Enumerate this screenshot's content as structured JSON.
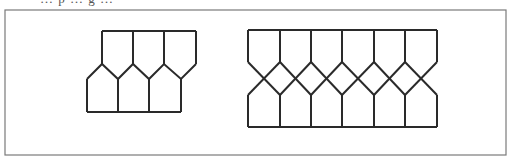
{
  "caption_fragment": "… p … g …",
  "figure": {
    "frame": {
      "x": 5,
      "y": 10,
      "width": 501,
      "height": 145,
      "stroke": "#7a7a7a"
    },
    "stroke_color": "#2a2a2a",
    "patterns": [
      {
        "name": "left-pattern",
        "description": "Three-column tiling of pentagons with single zigzag band",
        "columns": 3,
        "top_y": 31,
        "zig_peak_y": 64,
        "zig_valley_y": 79,
        "bottom_y": 112,
        "top_x": [
          102,
          133,
          164,
          196
        ],
        "bottom_x": [
          87,
          118,
          149,
          181
        ]
      },
      {
        "name": "right-pattern",
        "description": "Six-column tiling with crossing zigzags forming diamonds",
        "columns": 6,
        "top_y": 30,
        "upper_zig_y": 62,
        "cross_y": 79,
        "lower_zig_y": 95,
        "bottom_y": 127,
        "x": [
          248,
          280,
          311,
          342,
          374,
          405,
          437
        ]
      }
    ]
  }
}
